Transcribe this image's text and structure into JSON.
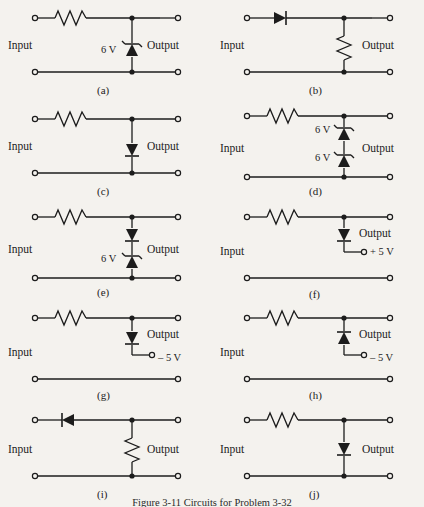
{
  "figure": {
    "caption": "Figure 3-11   Circuits for Problem 3-32",
    "background_color": "#f4f2ee",
    "ink_color": "#1c1c1c",
    "columns": 2,
    "rows": 5,
    "total_circuits": 10
  },
  "common": {
    "input_label": "Input",
    "output_label": "Output",
    "terminal_symbol": "open-circle",
    "junction_symbol": "filled-dot"
  },
  "circuits": [
    {
      "tag": "(a)",
      "input_label": "Input",
      "output_label": "Output",
      "series_element": "resistor",
      "shunt_element": "zener-diode",
      "shunt_orientation": "cathode-up",
      "voltage_label": "6 V",
      "voltage_label_position": "left-of-diode",
      "bias_terminal": null
    },
    {
      "tag": "(b)",
      "input_label": "Input",
      "output_label": "Output",
      "series_element": "diode",
      "series_orientation": "pointing-right",
      "shunt_element": "resistor",
      "voltage_label": null,
      "bias_terminal": null
    },
    {
      "tag": "(c)",
      "input_label": "Input",
      "output_label": "Output",
      "series_element": "resistor",
      "shunt_element": "diode",
      "shunt_orientation": "pointing-down",
      "voltage_label": null,
      "bias_terminal": null
    },
    {
      "tag": "(d)",
      "input_label": "Input",
      "output_label": "Output",
      "series_element": "resistor",
      "shunt_element": "two-zener-diodes-series",
      "voltage_label_top": "6 V",
      "voltage_label_bottom": "6 V",
      "bias_terminal": null
    },
    {
      "tag": "(e)",
      "input_label": "Input",
      "output_label": "Output",
      "series_element": "resistor",
      "shunt_element": "diode-over-zener",
      "voltage_label": "6 V",
      "voltage_label_position": "left-of-lower-diode",
      "bias_terminal": null
    },
    {
      "tag": "(f)",
      "input_label": "Input",
      "output_label": "Output",
      "series_element": "resistor",
      "shunt_element": "diode",
      "shunt_orientation": "pointing-down",
      "voltage_label": null,
      "bias_terminal": "+ 5 V"
    },
    {
      "tag": "(g)",
      "input_label": "Input",
      "output_label": "Output",
      "series_element": "resistor",
      "shunt_element": "diode",
      "shunt_orientation": "pointing-down",
      "voltage_label": null,
      "bias_terminal": "– 5 V"
    },
    {
      "tag": "(h)",
      "input_label": "Input",
      "output_label": "Output",
      "series_element": "resistor",
      "shunt_element": "diode",
      "shunt_orientation": "pointing-up",
      "voltage_label": null,
      "bias_terminal": "– 5 V"
    },
    {
      "tag": "(i)",
      "input_label": "Input",
      "output_label": "Output",
      "series_element": "diode",
      "series_orientation": "pointing-left",
      "shunt_element": "resistor",
      "voltage_label": null,
      "bias_terminal": null
    },
    {
      "tag": "(j)",
      "input_label": "Input",
      "output_label": "Output",
      "series_element": "resistor",
      "shunt_element": "diode",
      "shunt_orientation": "pointing-down",
      "voltage_label": null,
      "bias_terminal": null
    }
  ]
}
